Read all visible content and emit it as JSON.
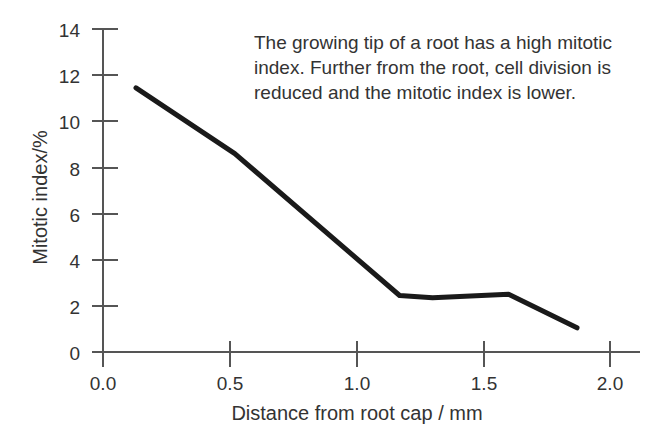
{
  "chart_data": {
    "type": "line",
    "title": "",
    "subtitle": "",
    "xlabel": "Distance from root cap / mm",
    "ylabel": "Mitotic index/%",
    "xlim": [
      0.0,
      2.0
    ],
    "ylim": [
      0,
      14
    ],
    "xticks": [
      "0.0",
      "0.5",
      "1.0",
      "1.5",
      "2.0"
    ],
    "xtick_values": [
      0.0,
      0.5,
      1.0,
      1.5,
      2.0
    ],
    "yticks": [
      "0",
      "2",
      "4",
      "6",
      "8",
      "10",
      "12",
      "14"
    ],
    "ytick_values": [
      0,
      2,
      4,
      6,
      8,
      10,
      12,
      14
    ],
    "grid": false,
    "legend": "none",
    "series": [
      {
        "name": "Mitotic index",
        "color": "#1a1a1a",
        "line_width": 5,
        "x": [
          0.13,
          0.52,
          1.17,
          1.3,
          1.6,
          1.87
        ],
        "values": [
          11.45,
          8.6,
          2.45,
          2.35,
          2.5,
          1.05
        ]
      }
    ],
    "annotations": [
      {
        "name": "description",
        "text": "The growing tip of a root has a high mitotic index. Further from the root, cell division is reduced and the mitotic index is lower."
      }
    ]
  },
  "axes": {
    "y_title": "Mitotic index/%",
    "x_title": "Distance from root cap / mm",
    "axis_color": "#555555",
    "tick_color": "#555555"
  },
  "annotation": {
    "text": "The growing tip of a root has a high mitotic index. Further from the root, cell division is reduced and the mitotic index is lower."
  }
}
